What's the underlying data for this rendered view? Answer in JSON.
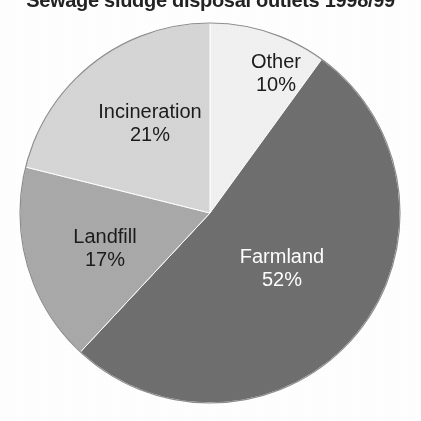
{
  "chart_data": {
    "type": "pie",
    "title": "Sewage sludge disposal outlets 1998/99",
    "subtitle": "",
    "xlabel": "",
    "ylabel": "",
    "legend_position": "none",
    "grid": false,
    "labels_inside_slices": true,
    "start_angle_deg": 0,
    "direction": "clockwise",
    "units": "percent",
    "categories": [
      "Other",
      "Farmland",
      "Landfill",
      "Incineration"
    ],
    "values": [
      10,
      52,
      17,
      21
    ],
    "slices": [
      {
        "name": "Other",
        "value": 10,
        "value_label": "10%",
        "color": "#f1f1f1",
        "text_color": "#1b1b1b",
        "start_deg": 0,
        "end_deg": 36
      },
      {
        "name": "Farmland",
        "value": 52,
        "value_label": "52%",
        "color": "#6f6f6f",
        "text_color": "#ffffff",
        "start_deg": 36,
        "end_deg": 223
      },
      {
        "name": "Landfill",
        "value": 17,
        "value_label": "17%",
        "color": "#a9a9a9",
        "text_color": "#1b1b1b",
        "start_deg": 223,
        "end_deg": 284
      },
      {
        "name": "Incineration",
        "value": 21,
        "value_label": "21%",
        "color": "#d6d6d6",
        "text_color": "#1b1b1b",
        "start_deg": 284,
        "end_deg": 360
      }
    ],
    "geometry": {
      "center_x": 210,
      "center_y": 213,
      "radius": 190
    },
    "background_color": "#ffffff",
    "outline_color": "#8e8e8e"
  }
}
